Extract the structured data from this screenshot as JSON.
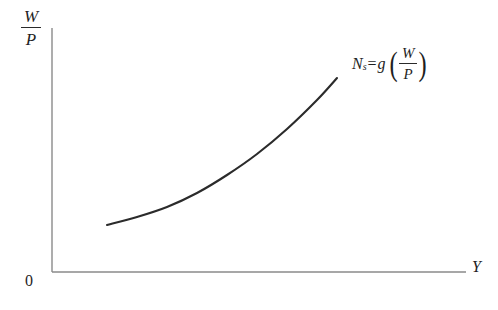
{
  "figure": {
    "background_color": "#ffffff",
    "axis_color": "#8a8a8a",
    "curve_color": "#2b2b2b",
    "text_color": "#1f1f1f",
    "origin_label": "0",
    "y_axis_label": {
      "numerator": "W",
      "denominator": "P"
    },
    "x_axis_label": "Y",
    "curve_label": {
      "symbol": "N",
      "subscript": "s",
      "equals": "=",
      "function": "g",
      "open_paren": "(",
      "close_paren": ")",
      "argument_numerator": "W",
      "argument_denominator": "P"
    }
  },
  "chart_data": {
    "type": "line",
    "title": "",
    "xlabel": "Y",
    "ylabel": "W/P",
    "grid": false,
    "legend": "none",
    "annotations": [
      "Ns=g(W/P)"
    ],
    "axes": {
      "origin_px": [
        52,
        272
      ],
      "x_axis_end_px": [
        466,
        272
      ],
      "y_axis_top_px": [
        52,
        28
      ],
      "xlim": [
        0,
        1
      ],
      "ylim": [
        0,
        1
      ]
    },
    "series": [
      {
        "name": "Ns=g(W/P)",
        "shape": "convex-increasing",
        "x": [
          0.133,
          0.205,
          0.277,
          0.35,
          0.422,
          0.495,
          0.567,
          0.64,
          0.688
        ],
        "y": [
          0.193,
          0.225,
          0.268,
          0.325,
          0.397,
          0.484,
          0.586,
          0.703,
          0.795
        ],
        "points_px": [
          [
            107,
            225
          ],
          [
            137,
            217
          ],
          [
            167,
            207
          ],
          [
            197,
            193
          ],
          [
            227,
            175
          ],
          [
            257,
            154
          ],
          [
            287,
            129
          ],
          [
            317,
            100
          ],
          [
            337,
            78
          ]
        ]
      }
    ]
  }
}
